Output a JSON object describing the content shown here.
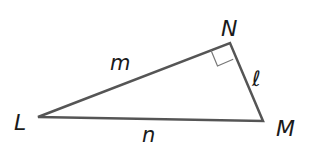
{
  "diagram": {
    "type": "right-triangle",
    "stroke_color": "#555555",
    "label_color": "#1a1a1a",
    "vertices": [
      {
        "name": "L",
        "x": 38,
        "y": 117
      },
      {
        "name": "N",
        "x": 230,
        "y": 43
      },
      {
        "name": "M",
        "x": 263,
        "y": 121
      }
    ],
    "vertex_labels": {
      "L": "L",
      "N": "N",
      "M": "M"
    },
    "side_labels": {
      "LN": "m",
      "NM": "ℓ",
      "LM": "n"
    },
    "right_angle_at": "N"
  }
}
